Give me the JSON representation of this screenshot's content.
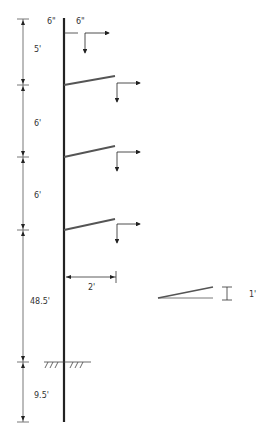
{
  "diagram": {
    "colors": {
      "line": "#222222",
      "dim": "#555555",
      "arm": "#555555",
      "text": "#333333"
    },
    "top_labels": {
      "pole_top": "6\"",
      "arm_offset": "6\""
    },
    "vertical_dimensions": [
      {
        "label": "5'",
        "from_y": 19,
        "to_y": 85
      },
      {
        "label": "6'",
        "from_y": 85,
        "to_y": 157
      },
      {
        "label": "6'",
        "from_y": 157,
        "to_y": 230
      },
      {
        "label": "48.5'",
        "from_y": 230,
        "to_y": 362
      },
      {
        "label": "9.5'",
        "from_y": 362,
        "to_y": 422
      }
    ],
    "arm_length_label": "2'",
    "detail_rise_label": "1'",
    "ground_label": "ground line"
  }
}
